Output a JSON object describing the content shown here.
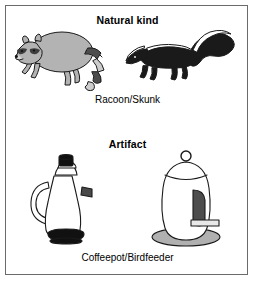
{
  "figure": {
    "background_color": "#ffffff",
    "frame_color": "#6b6b6b",
    "panels": [
      {
        "id": "natural",
        "heading": "Natural kind",
        "caption": "Racoon/Skunk",
        "illustrations": [
          {
            "name": "raccoon",
            "description": "Raccoon drawn in profile facing left, rounded gray body, masked face, ringed tail",
            "body_color": "#b3b3b3",
            "stripe_dark_color": "#4d4d4d",
            "stripe_light_color": "#cccccc",
            "outline_color": "#1a1a1a"
          },
          {
            "name": "skunk",
            "description": "Skunk drawn in profile facing left, solid black body with white stripe down back and bushy tail",
            "body_color": "#1a1a1a",
            "stripe_color": "#ffffff",
            "outline_color": "#1a1a1a"
          }
        ]
      },
      {
        "id": "artifact",
        "heading": "Artifact",
        "caption": "Coffeepot/Birdfeeder",
        "illustrations": [
          {
            "name": "coffeepot",
            "description": "White coffeepot with black knob lid, curved side handle on left, small spout on right, black ring base",
            "body_color": "#ffffff",
            "accent_color": "#111111",
            "outline_color": "#1a1a1a"
          },
          {
            "name": "birdfeeder",
            "description": "White ovoid birdfeeder with hanging ring on top, dark feeding port on right side, perch stick, gray elliptical tray base",
            "body_color": "#ffffff",
            "port_color": "#4d4d4d",
            "tray_color": "#b0b0b0",
            "outline_color": "#1a1a1a"
          }
        ]
      }
    ]
  }
}
